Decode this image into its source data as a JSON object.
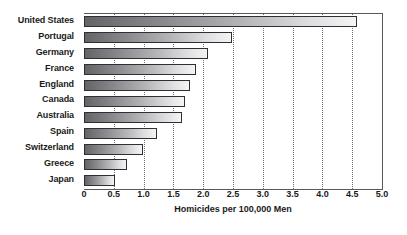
{
  "chart_data": {
    "type": "bar",
    "orientation": "horizontal",
    "title": "",
    "xlabel": "Homicides per 100,000 Men",
    "ylabel": "",
    "categories": [
      "United States",
      "Portugal",
      "Germany",
      "France",
      "England",
      "Canada",
      "Australia",
      "Spain",
      "Switzerland",
      "Greece",
      "Japan"
    ],
    "values": [
      4.58,
      2.48,
      2.08,
      1.88,
      1.78,
      1.7,
      1.64,
      1.22,
      0.99,
      0.72,
      0.52
    ],
    "xlim": [
      0,
      5.0
    ],
    "xticks": [
      "0",
      "0.5",
      "1.0",
      "1.5",
      "2.0",
      "2.5",
      "3.0",
      "3.5",
      "4.0",
      "4.5",
      "5.0"
    ],
    "xtick_values": [
      0,
      0.5,
      1.0,
      1.5,
      2.0,
      2.5,
      3.0,
      3.5,
      4.0,
      4.5,
      5.0
    ],
    "grid": "vertical-dotted",
    "legend": "none",
    "bar_gradient_start": "#646468",
    "bar_gradient_end": "#f4f4f5",
    "bar_border_color": "#2f2f33",
    "axis_color": "#59595c",
    "text_color": "#1a1a1a",
    "background": "#ffffff"
  }
}
